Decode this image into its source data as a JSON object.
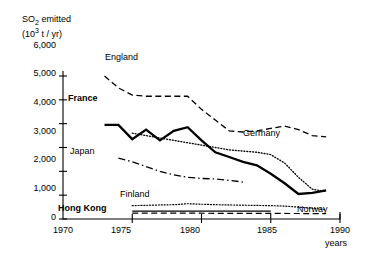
{
  "chart_data": {
    "type": "line",
    "title": "",
    "ylabel_line1": "SO2 emitted",
    "ylabel_line2": "(103 t / yr)",
    "ylabel_main": "SO",
    "ylabel_sub": "2",
    "ylabel_rest": " emitted",
    "ylabel_units_pre": "(10",
    "ylabel_units_sup": "3",
    "ylabel_units_post": " t / yr)",
    "xlabel": "years",
    "xlim": [
      1970,
      1990
    ],
    "ylim": [
      0,
      6000
    ],
    "grid": false,
    "legend_position": "inline-labels",
    "yticks": [
      0,
      1000,
      2000,
      3000,
      4000,
      5000,
      6000
    ],
    "ytick_labels": [
      "0",
      "1,000",
      "2,000",
      "3,000",
      "4,000",
      "5,000",
      "6,000"
    ],
    "xticks": [
      1970,
      1975,
      1980,
      1985,
      1990
    ],
    "xtick_labels": [
      "1970",
      "1975",
      "1980",
      "1985",
      "1990"
    ],
    "series": [
      {
        "name": "England",
        "style": "dashed",
        "color": "#000000",
        "label": "England",
        "x": [
          1973,
          1974,
          1975,
          1976,
          1977,
          1978,
          1979,
          1980,
          1981,
          1982,
          1983,
          1984,
          1985,
          1986,
          1987,
          1988,
          1989
        ],
        "values": [
          6000,
          5500,
          5200,
          5150,
          5150,
          5150,
          5150,
          4600,
          4150,
          3700,
          3650,
          3700,
          3800,
          3900,
          3750,
          3500,
          3450
        ]
      },
      {
        "name": "France",
        "style": "solid-thick",
        "color": "#000000",
        "label": "France",
        "x": [
          1973,
          1974,
          1975,
          1976,
          1977,
          1978,
          1979,
          1980,
          1981,
          1982,
          1983,
          1984,
          1985,
          1986,
          1987,
          1988,
          1989
        ],
        "values": [
          3950,
          3950,
          3350,
          3750,
          3300,
          3700,
          3850,
          3300,
          2800,
          2600,
          2400,
          2250,
          1900,
          1500,
          1050,
          1100,
          1200
        ]
      },
      {
        "name": "Germany",
        "style": "dotted",
        "color": "#000000",
        "label": "Germany",
        "x": [
          1975,
          1976,
          1977,
          1978,
          1979,
          1980,
          1981,
          1982,
          1983,
          1984,
          1985,
          1986,
          1987,
          1988,
          1989
        ],
        "values": [
          3600,
          3500,
          3400,
          3300,
          3200,
          3100,
          3000,
          2900,
          2850,
          2800,
          2700,
          2350,
          1750,
          1250,
          1150
        ]
      },
      {
        "name": "Japan",
        "style": "dash-dot",
        "color": "#000000",
        "label": "Japan",
        "x": [
          1974,
          1975,
          1976,
          1977,
          1978,
          1979,
          1980,
          1981,
          1982,
          1983
        ],
        "values": [
          2550,
          2400,
          2200,
          2000,
          1850,
          1750,
          1700,
          1680,
          1620,
          1550
        ]
      },
      {
        "name": "Finland",
        "style": "dotted",
        "color": "#000000",
        "label": "Finland",
        "x": [
          1975,
          1976,
          1977,
          1978,
          1979,
          1980,
          1981,
          1982,
          1983,
          1984,
          1985,
          1986,
          1987,
          1988,
          1989
        ],
        "values": [
          560,
          575,
          590,
          600,
          640,
          620,
          600,
          590,
          580,
          570,
          560,
          540,
          500,
          450,
          400
        ]
      },
      {
        "name": "Hong Kong",
        "style": "solid-thin",
        "color": "#000000",
        "label": "Hong Kong",
        "x": [
          1975,
          1977,
          1979,
          1981,
          1983,
          1985
        ],
        "values": [
          330,
          330,
          330,
          330,
          330,
          330
        ]
      },
      {
        "name": "Norway",
        "style": "dashed",
        "color": "#000000",
        "label": "Norway",
        "x": [
          1975,
          1977,
          1979,
          1981,
          1983,
          1985,
          1987,
          1989
        ],
        "values": [
          250,
          245,
          245,
          240,
          240,
          235,
          230,
          225
        ]
      }
    ]
  },
  "labels": {
    "england": "England",
    "france": "France",
    "germany": "Germany",
    "japan": "Japan",
    "finland": "Finland",
    "hongkong": "Hong Kong",
    "norway": "Norway",
    "years": "years"
  },
  "yticks": {
    "t0": "0",
    "t1": "1,000",
    "t2": "2,000",
    "t3": "3,000",
    "t4": "4,000",
    "t5": "5,000",
    "t6": "6,000"
  },
  "xticks": {
    "x1970": "1970",
    "x1975": "1975",
    "x1980": "1980",
    "x1985": "1985",
    "x1990": "1990"
  },
  "axis_title": {
    "so": "SO",
    "two": "2",
    "emitted": " emitted",
    "units_pre": "(10",
    "units_sup": "3",
    "units_post": " t / yr)"
  }
}
